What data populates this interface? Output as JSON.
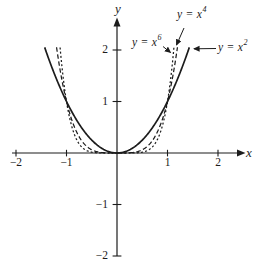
{
  "figure": {
    "background": "#ffffff",
    "ink": "#1c1c1c"
  },
  "axes": {
    "x_label": "x",
    "y_label": "y",
    "x_ticks": [
      {
        "value": -2,
        "label": "−2"
      },
      {
        "value": -1,
        "label": "−1"
      },
      {
        "value": 1,
        "label": "1"
      },
      {
        "value": 2,
        "label": "2"
      }
    ],
    "y_ticks": [
      {
        "value": 2,
        "label": "2"
      },
      {
        "value": 1,
        "label": "1"
      },
      {
        "value": -1,
        "label": "−1"
      },
      {
        "value": -2,
        "label": "−2"
      }
    ]
  },
  "chart_data": {
    "type": "line",
    "title": "",
    "xlabel": "x",
    "ylabel": "y",
    "xlim": [
      -2.3,
      2.45
    ],
    "ylim": [
      -2.1,
      2.6
    ],
    "grid": false,
    "legend_position": "inline-annotations",
    "series": [
      {
        "id": "y-x2",
        "name": "y = x^2",
        "exponent": 2,
        "line_style": "solid",
        "x_range": [
          -1.432,
          1.432
        ],
        "key_points": [
          [
            -1,
            1
          ],
          [
            0,
            0
          ],
          [
            1,
            1
          ]
        ]
      },
      {
        "id": "y-x4",
        "name": "y = x^4",
        "exponent": 4,
        "line_style": "dashed",
        "x_range": [
          -1.197,
          1.197
        ],
        "key_points": [
          [
            -1,
            1
          ],
          [
            0,
            0
          ],
          [
            1,
            1
          ]
        ]
      },
      {
        "id": "y-x6",
        "name": "y = x^6",
        "exponent": 6,
        "line_style": "dotted",
        "x_range": [
          -1.127,
          1.127
        ],
        "key_points": [
          [
            -1,
            1
          ],
          [
            0,
            0
          ],
          [
            1,
            1
          ]
        ]
      }
    ]
  },
  "curve_labels": {
    "x4": {
      "base": "y = x",
      "exp": "4"
    },
    "x6": {
      "base": "y = x",
      "exp": "6"
    },
    "x2": {
      "base": "y = x",
      "exp": "2"
    }
  }
}
